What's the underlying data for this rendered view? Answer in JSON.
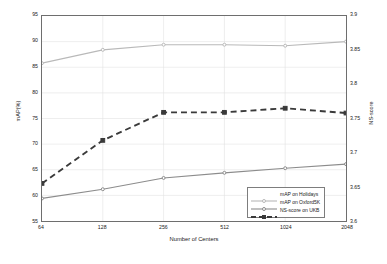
{
  "chart_data": {
    "type": "line",
    "title": "",
    "xlabel": "Number of Centers",
    "ylabel": "mAP(%)",
    "y2label": "NS-score",
    "x": [
      64,
      128,
      256,
      512,
      1024,
      2048
    ],
    "xtick_labels": [
      "64",
      "128",
      "256",
      "512",
      "1024",
      "2048"
    ],
    "xscale": "log2",
    "ylim": [
      55,
      95
    ],
    "ytick_labels": [
      "55",
      "60",
      "65",
      "70",
      "75",
      "80",
      "85",
      "90",
      "95"
    ],
    "ytick_values": [
      55,
      60,
      65,
      70,
      75,
      80,
      85,
      90,
      95
    ],
    "y2lim": [
      3.6,
      3.9
    ],
    "y2tick_labels": [
      "3.6",
      "3.65",
      "3.7",
      "3.75",
      "3.8",
      "3.85",
      "3.9"
    ],
    "y2tick_values": [
      3.6,
      3.65,
      3.7,
      3.75,
      3.8,
      3.85,
      3.9
    ],
    "grid": true,
    "legend_position": "lower right",
    "series": [
      {
        "name": "mAP on Holidays",
        "axis": "left",
        "color": "#b9b9b9",
        "linestyle": "solid",
        "marker": "circle",
        "values": [
          85.8,
          88.4,
          89.4,
          89.4,
          89.2,
          90.0
        ]
      },
      {
        "name": "mAP on Oxford5K",
        "axis": "left",
        "color": "#8c8c8c",
        "linestyle": "solid",
        "marker": "circle",
        "values": [
          59.4,
          61.2,
          63.4,
          64.4,
          65.3,
          66.1
        ]
      },
      {
        "name": "NS-score on UKB",
        "axis": "right",
        "color": "#3a3a3a",
        "linestyle": "dashed",
        "marker": "square",
        "values": [
          3.655,
          3.718,
          3.759,
          3.759,
          3.765,
          3.758
        ]
      }
    ]
  },
  "legend": {
    "items": [
      {
        "label": "mAP on Holidays"
      },
      {
        "label": "mAP on Oxford5K"
      },
      {
        "label": "NS-score on UKB"
      }
    ]
  }
}
